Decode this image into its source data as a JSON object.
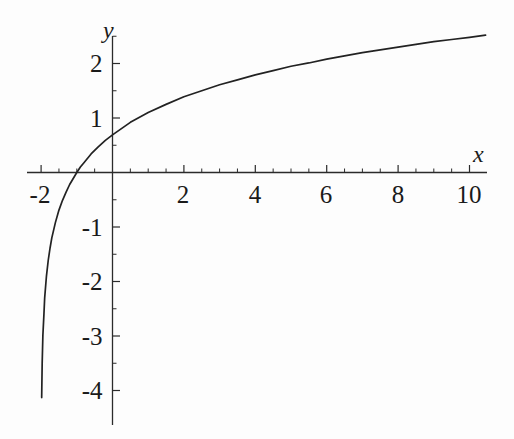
{
  "figure": {
    "background_color": "#fdfdfd",
    "line_color": "#222222",
    "axis_color": "#2b2b2b"
  },
  "axis_labels": {
    "x": "x",
    "y": "y"
  },
  "x_tick_labels": [
    {
      "text": "-2",
      "value": -2,
      "px": 40
    },
    {
      "text": "2",
      "value": 2,
      "px": 183
    },
    {
      "text": "4",
      "value": 4,
      "px": 255
    },
    {
      "text": "6",
      "value": 6,
      "px": 326
    },
    {
      "text": "8",
      "value": 8,
      "px": 398
    },
    {
      "text": "10",
      "value": 10,
      "px": 469
    }
  ],
  "y_tick_labels": [
    {
      "text": "2",
      "value": 2,
      "px": 63
    },
    {
      "text": "1",
      "value": 1,
      "px": 118
    },
    {
      "text": "-1",
      "value": -1,
      "px": 227
    },
    {
      "text": "-2",
      "value": -2,
      "px": 281
    },
    {
      "text": "-3",
      "value": -3,
      "px": 336
    },
    {
      "text": "-4",
      "value": -4,
      "px": 390
    }
  ],
  "chart_data": {
    "type": "line",
    "title": "",
    "subtitle": "",
    "xlabel": "x",
    "ylabel": "y",
    "function": "y = ln(x + 2)",
    "grid": false,
    "legend": false,
    "legend_position": "none",
    "axes_style": "centered-cross",
    "xlim": [
      -2.4,
      10.5
    ],
    "ylim": [
      -4.35,
      2.55
    ],
    "x_ticks_major": [
      -2,
      2,
      4,
      6,
      8,
      10
    ],
    "x_ticks_minor": [
      -1.5,
      -1,
      -0.5,
      0.5,
      1,
      1.5,
      2.5,
      3,
      3.5,
      4.5,
      5,
      5.5,
      6.5,
      7,
      7.5,
      8.5,
      9,
      9.5
    ],
    "y_ticks_major": [
      2,
      1,
      -1,
      -2,
      -3,
      -4
    ],
    "y_ticks_minor": [
      2.5,
      1.5,
      0.5,
      -0.5,
      -1.5,
      -2.5,
      -3.5
    ],
    "series": [
      {
        "name": "ln(x+2)",
        "x": [
          -1.984,
          -1.97,
          -1.95,
          -1.92,
          -1.9,
          -1.85,
          -1.8,
          -1.75,
          -1.7,
          -1.6,
          -1.5,
          -1.4,
          -1.3,
          -1.2,
          -1.1,
          -1.0,
          -0.9,
          -0.8,
          -0.6,
          -0.4,
          -0.2,
          0,
          0.5,
          1,
          1.5,
          2,
          2.5,
          3,
          3.5,
          4,
          4.5,
          5,
          5.5,
          6,
          6.5,
          7,
          7.5,
          8,
          8.5,
          9,
          9.5,
          10,
          10.45
        ],
        "y": [
          -4.13,
          -3.51,
          -2.99,
          -2.59,
          -2.3,
          -1.9,
          -1.61,
          -1.39,
          -1.2,
          -0.92,
          -0.69,
          -0.51,
          -0.36,
          -0.22,
          -0.11,
          0.0,
          0.1,
          0.18,
          0.34,
          0.47,
          0.59,
          0.69,
          0.92,
          1.1,
          1.25,
          1.39,
          1.5,
          1.61,
          1.7,
          1.79,
          1.87,
          1.95,
          2.01,
          2.08,
          2.14,
          2.2,
          2.25,
          2.3,
          2.35,
          2.4,
          2.44,
          2.48,
          2.52
        ]
      }
    ],
    "notable_points": [
      {
        "label": "y-intercept",
        "x": 0,
        "y": 0.693
      },
      {
        "label": "x-intercept",
        "x": -1,
        "y": 0
      },
      {
        "label": "vertical asymptote",
        "x": -2,
        "y": null
      }
    ]
  }
}
